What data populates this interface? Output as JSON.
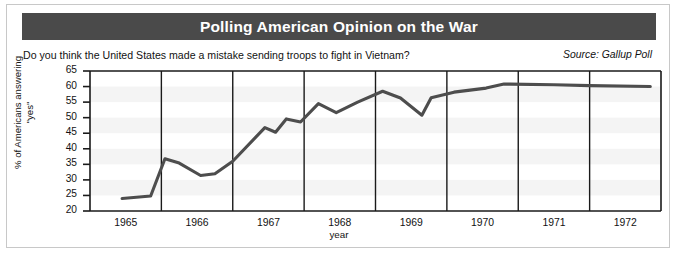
{
  "header": {
    "title": "Polling American Opinion on the War"
  },
  "subtitle": "Do you think the United States made a mistake sending troops to fight in Vietnam?",
  "source": "Source: Gallup Poll",
  "colors": {
    "title_bar": "#4a4a4a",
    "title_text": "#ffffff",
    "line": "#4d4d4d",
    "axis": "#1a1a1a",
    "gridline": "#1a1a1a",
    "background": "#ffffff",
    "border": "#c8c8c8"
  },
  "chart_data": {
    "type": "line",
    "title": "Polling American Opinion on the War",
    "subtitle": "Do you think the United States made a mistake sending troops to fight in Vietnam?",
    "source": "Source: Gallup Poll",
    "xlabel": "year",
    "ylabel": "% of Americans answering \"yes\"",
    "xlim": [
      1965.0,
      1973.0
    ],
    "ylim": [
      20,
      65
    ],
    "yticks": [
      20,
      25,
      30,
      35,
      40,
      45,
      50,
      55,
      60,
      65
    ],
    "ytick_labels": [
      "20",
      "25",
      "30",
      "35",
      "40",
      "45",
      "50",
      "55",
      "60",
      "65"
    ],
    "xticks": [
      1965,
      1966,
      1967,
      1968,
      1969,
      1970,
      1971,
      1972
    ],
    "xtick_labels": [
      "1965",
      "1966",
      "1967",
      "1968",
      "1969",
      "1970",
      "1971",
      "1972"
    ],
    "gridlines_x": [
      1966,
      1967,
      1968,
      1969,
      1970,
      1971,
      1972
    ],
    "grid": "vertical-year-boundaries",
    "legend": "none",
    "series": [
      {
        "name": "% of Americans answering \"yes\"",
        "x": [
          1965.45,
          1965.85,
          1966.05,
          1966.25,
          1966.55,
          1966.75,
          1967.0,
          1967.45,
          1967.6,
          1967.75,
          1967.95,
          1968.2,
          1968.45,
          1968.75,
          1969.1,
          1969.35,
          1969.65,
          1969.78,
          1970.1,
          1970.55,
          1970.8,
          1971.5,
          1972.0,
          1972.85
        ],
        "y": [
          24.0,
          24.8,
          36.8,
          35.4,
          31.4,
          32.0,
          36.0,
          46.8,
          45.3,
          49.6,
          48.6,
          54.5,
          51.6,
          55.0,
          58.5,
          56.3,
          50.8,
          56.4,
          58.2,
          59.5,
          60.8,
          60.6,
          60.3,
          60.0
        ]
      }
    ]
  }
}
